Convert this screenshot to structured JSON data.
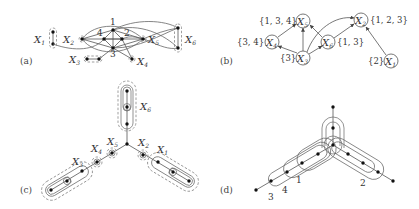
{
  "figure": {
    "panels": [
      {
        "id": "a",
        "label": "(a)",
        "description": "Graph with vertex groups X1..X6 and numbered vertices 1-4",
        "groups": [
          "X1",
          "X2",
          "X3",
          "X4",
          "X5",
          "X6"
        ],
        "numbered_vertices": [
          "1",
          "2",
          "3",
          "4"
        ]
      },
      {
        "id": "b",
        "label": "(b)",
        "description": "Directed graph of groups with label sets",
        "nodes": [
          {
            "name": "X1",
            "set": "{2}"
          },
          {
            "name": "X2",
            "set": "{1,2,3}"
          },
          {
            "name": "X3",
            "set": "{3}"
          },
          {
            "name": "X4",
            "set": "{3,4}"
          },
          {
            "name": "X5",
            "set": "{1,3,4}"
          },
          {
            "name": "X6",
            "set": "{1,3}"
          }
        ],
        "arcs": [
          [
            "X1",
            "X2"
          ],
          [
            "X3",
            "X4"
          ],
          [
            "X3",
            "X5"
          ],
          [
            "X3",
            "X6"
          ],
          [
            "X3",
            "X2"
          ],
          [
            "X4",
            "X5"
          ],
          [
            "X6",
            "X5"
          ],
          [
            "X6",
            "X2"
          ]
        ]
      },
      {
        "id": "c",
        "label": "(c)",
        "description": "Star-shaped tree with three arms and nested groups",
        "groups": [
          "X1",
          "X2",
          "X3",
          "X4",
          "X5",
          "X6"
        ]
      },
      {
        "id": "d",
        "label": "(d)",
        "description": "Star-shaped tree with nested path regions numbered 1-4",
        "regions": [
          "1",
          "2",
          "3",
          "4"
        ]
      }
    ]
  },
  "text": {
    "X": "X",
    "s1": "1",
    "s2": "2",
    "s3": "3",
    "s4": "4",
    "s5": "5",
    "s6": "6",
    "n1": "1",
    "n2": "2",
    "n3": "3",
    "n4": "4",
    "set_x1": "{2}",
    "set_x2": "{1, 2, 3}",
    "set_x3": "{3}",
    "set_x4": "{3, 4}",
    "set_x5": "{1, 3, 4}",
    "set_x6": "{1, 3}",
    "label_a": "(a)",
    "label_b": "(b)",
    "label_c": "(c)",
    "label_d": "(d)"
  },
  "colors": {
    "ink": "#333333",
    "vertex": "#111111",
    "background": "#ffffff"
  }
}
